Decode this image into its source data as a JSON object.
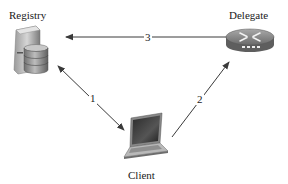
{
  "diagram": {
    "type": "network-interaction",
    "nodes": [
      {
        "id": "registry",
        "label": "Registry",
        "icon": "database-server-icon"
      },
      {
        "id": "delegate",
        "label": "Delegate",
        "icon": "router-icon"
      },
      {
        "id": "client",
        "label": "Client",
        "icon": "laptop-icon"
      }
    ],
    "edges": [
      {
        "id": "e1",
        "label": "1",
        "from": "registry",
        "to": "client",
        "direction": "bidirectional"
      },
      {
        "id": "e2",
        "label": "2",
        "from": "client",
        "to": "delegate",
        "direction": "forward"
      },
      {
        "id": "e3",
        "label": "3",
        "from": "registry",
        "to": "delegate",
        "direction": "bidirectional"
      }
    ],
    "colors": {
      "arrow": "#3a3a3a",
      "text": "#1a1a1a",
      "background": "#ffffff"
    }
  }
}
